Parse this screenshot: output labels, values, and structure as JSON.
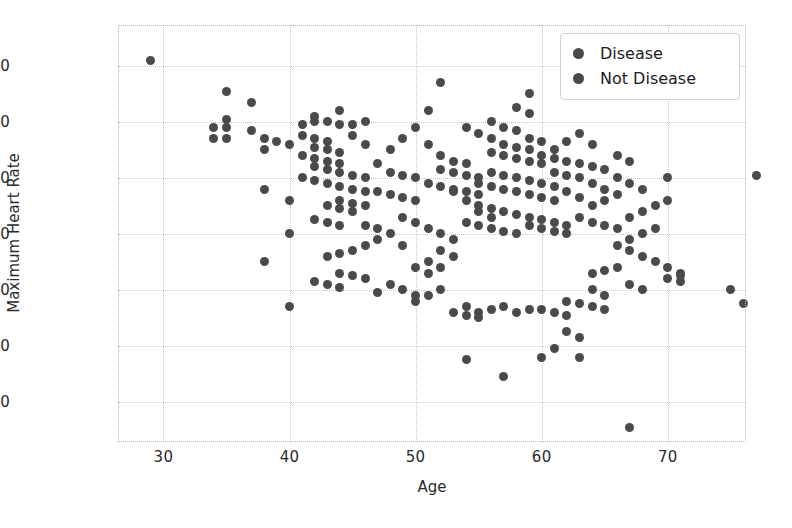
{
  "chart_data": {
    "type": "scatter",
    "title": "",
    "xlabel": "Age",
    "ylabel": "Maximum Heart Rate",
    "xlim": [
      26.4,
      76.2
    ],
    "ylim": [
      65.7,
      214.6
    ],
    "xticks": [
      30,
      40,
      50,
      60,
      70
    ],
    "yticks": [
      80,
      100,
      120,
      140,
      160,
      180,
      200
    ],
    "grid": true,
    "legend_position": "upper right",
    "marker_size_px": 9,
    "series": [
      {
        "name": "Disease",
        "color": "#4a4a4a",
        "points": [
          [
            29,
            202
          ],
          [
            35,
            191
          ],
          [
            37,
            187
          ],
          [
            35,
            181
          ],
          [
            34,
            178
          ],
          [
            35,
            178
          ],
          [
            37,
            177
          ],
          [
            38,
            174
          ],
          [
            34,
            174
          ],
          [
            35,
            174
          ],
          [
            39,
            173
          ],
          [
            40,
            172
          ],
          [
            38,
            170
          ],
          [
            41,
            179
          ],
          [
            42,
            180
          ],
          [
            43,
            180
          ],
          [
            44,
            179
          ],
          [
            45,
            179
          ],
          [
            46,
            180
          ],
          [
            42,
            182
          ],
          [
            44,
            184
          ],
          [
            41,
            175
          ],
          [
            42,
            174
          ],
          [
            43,
            173
          ],
          [
            42,
            171
          ],
          [
            43,
            170
          ],
          [
            44,
            169
          ],
          [
            41,
            168
          ],
          [
            42,
            167
          ],
          [
            43,
            166
          ],
          [
            44,
            165
          ],
          [
            42,
            164
          ],
          [
            43,
            163
          ],
          [
            45,
            175
          ],
          [
            46,
            172
          ],
          [
            44,
            162
          ],
          [
            45,
            161
          ],
          [
            46,
            160
          ],
          [
            41,
            160
          ],
          [
            42,
            159
          ],
          [
            43,
            158
          ],
          [
            44,
            157
          ],
          [
            45,
            156
          ],
          [
            46,
            155
          ],
          [
            47,
            165
          ],
          [
            48,
            170
          ],
          [
            49,
            174
          ],
          [
            50,
            178
          ],
          [
            51,
            184
          ],
          [
            52,
            194
          ],
          [
            51,
            172
          ],
          [
            52,
            168
          ],
          [
            53,
            166
          ],
          [
            54,
            165
          ],
          [
            52,
            163
          ],
          [
            53,
            162
          ],
          [
            54,
            161
          ],
          [
            55,
            160
          ],
          [
            51,
            158
          ],
          [
            52,
            157
          ],
          [
            53,
            156
          ],
          [
            54,
            155
          ],
          [
            55,
            154
          ],
          [
            48,
            162
          ],
          [
            49,
            161
          ],
          [
            50,
            160
          ],
          [
            47,
            155
          ],
          [
            48,
            154
          ],
          [
            49,
            153
          ],
          [
            50,
            152
          ],
          [
            44,
            152
          ],
          [
            45,
            151
          ],
          [
            46,
            150
          ],
          [
            43,
            150
          ],
          [
            44,
            149
          ],
          [
            45,
            148
          ],
          [
            42,
            145
          ],
          [
            43,
            144
          ],
          [
            44,
            143
          ],
          [
            46,
            143
          ],
          [
            47,
            142
          ],
          [
            43,
            132
          ],
          [
            44,
            126
          ],
          [
            45,
            125
          ],
          [
            46,
            124
          ],
          [
            42,
            123
          ],
          [
            43,
            122
          ],
          [
            44,
            121
          ],
          [
            40,
            140
          ],
          [
            40,
            152
          ],
          [
            40,
            114
          ],
          [
            38,
            156
          ],
          [
            38,
            130
          ],
          [
            47,
            119
          ],
          [
            48,
            122
          ],
          [
            49,
            136
          ],
          [
            50,
            128
          ],
          [
            51,
            126
          ],
          [
            52,
            128
          ],
          [
            53,
            132
          ]
        ]
      },
      {
        "name": "Not Disease",
        "color": "#4a4a4a",
        "points": [
          [
            56,
            180
          ],
          [
            57,
            178
          ],
          [
            58,
            177
          ],
          [
            59,
            174
          ],
          [
            60,
            173
          ],
          [
            57,
            172
          ],
          [
            58,
            171
          ],
          [
            59,
            170
          ],
          [
            56,
            169
          ],
          [
            57,
            168
          ],
          [
            58,
            167
          ],
          [
            59,
            166
          ],
          [
            60,
            165
          ],
          [
            61,
            170
          ],
          [
            62,
            173
          ],
          [
            63,
            176
          ],
          [
            64,
            172
          ],
          [
            62,
            166
          ],
          [
            63,
            165
          ],
          [
            64,
            164
          ],
          [
            65,
            163
          ],
          [
            61,
            162
          ],
          [
            62,
            161
          ],
          [
            63,
            160
          ],
          [
            56,
            162
          ],
          [
            57,
            161
          ],
          [
            58,
            160
          ],
          [
            59,
            159
          ],
          [
            60,
            158
          ],
          [
            55,
            158
          ],
          [
            56,
            157
          ],
          [
            57,
            156
          ],
          [
            58,
            155
          ],
          [
            59,
            154
          ],
          [
            60,
            153
          ],
          [
            61,
            152
          ],
          [
            55,
            150
          ],
          [
            56,
            149
          ],
          [
            57,
            148
          ],
          [
            58,
            147
          ],
          [
            59,
            146
          ],
          [
            60,
            145
          ],
          [
            61,
            144
          ],
          [
            62,
            143
          ],
          [
            54,
            144
          ],
          [
            55,
            143
          ],
          [
            56,
            142
          ],
          [
            57,
            141
          ],
          [
            58,
            140
          ],
          [
            59,
            143
          ],
          [
            60,
            142
          ],
          [
            61,
            141
          ],
          [
            62,
            140
          ],
          [
            63,
            146
          ],
          [
            64,
            150
          ],
          [
            65,
            152
          ],
          [
            66,
            154
          ],
          [
            64,
            144
          ],
          [
            65,
            143
          ],
          [
            66,
            142
          ],
          [
            67,
            146
          ],
          [
            68,
            148
          ],
          [
            69,
            150
          ],
          [
            70,
            152
          ],
          [
            66,
            136
          ],
          [
            67,
            134
          ],
          [
            68,
            132
          ],
          [
            69,
            130
          ],
          [
            70,
            128
          ],
          [
            71,
            126
          ],
          [
            70,
            124
          ],
          [
            71,
            123
          ],
          [
            67,
            122
          ],
          [
            68,
            120
          ],
          [
            64,
            120
          ],
          [
            65,
            118
          ],
          [
            62,
            116
          ],
          [
            63,
            115
          ],
          [
            64,
            114
          ],
          [
            65,
            113
          ],
          [
            60,
            113
          ],
          [
            61,
            112
          ],
          [
            62,
            111
          ],
          [
            59,
            113
          ],
          [
            58,
            112
          ],
          [
            57,
            114
          ],
          [
            56,
            113
          ],
          [
            55,
            112
          ],
          [
            54,
            114
          ],
          [
            62,
            105
          ],
          [
            63,
            103
          ],
          [
            61,
            99
          ],
          [
            60,
            96
          ],
          [
            63,
            96
          ],
          [
            57,
            89
          ],
          [
            54,
            95
          ],
          [
            67,
            71
          ],
          [
            75,
            120
          ],
          [
            77,
            161
          ],
          [
            70,
            160
          ],
          [
            76,
            115
          ],
          [
            71,
            125
          ],
          [
            53,
            112
          ],
          [
            54,
            111
          ],
          [
            55,
            110
          ],
          [
            52,
            120
          ],
          [
            51,
            118
          ],
          [
            50,
            116
          ],
          [
            53,
            155
          ],
          [
            54,
            152
          ],
          [
            55,
            148
          ],
          [
            56,
            146
          ],
          [
            61,
            157
          ],
          [
            62,
            155
          ],
          [
            63,
            153
          ],
          [
            64,
            158
          ],
          [
            65,
            156
          ],
          [
            66,
            160
          ],
          [
            67,
            158
          ],
          [
            68,
            156
          ],
          [
            69,
            142
          ],
          [
            68,
            140
          ],
          [
            67,
            138
          ],
          [
            66,
            128
          ],
          [
            65,
            127
          ],
          [
            64,
            126
          ],
          [
            49,
            146
          ],
          [
            50,
            144
          ],
          [
            51,
            142
          ],
          [
            52,
            140
          ],
          [
            53,
            138
          ],
          [
            48,
            140
          ],
          [
            47,
            138
          ],
          [
            46,
            136
          ],
          [
            45,
            134
          ],
          [
            44,
            133
          ],
          [
            49,
            120
          ],
          [
            50,
            118
          ],
          [
            51,
            130
          ],
          [
            52,
            134
          ],
          [
            59,
            190
          ],
          [
            54,
            178
          ],
          [
            55,
            176
          ],
          [
            56,
            174
          ],
          [
            60,
            168
          ],
          [
            61,
            167
          ],
          [
            66,
            168
          ],
          [
            67,
            166
          ],
          [
            58,
            185
          ],
          [
            59,
            183
          ]
        ]
      }
    ]
  },
  "legend": {
    "items": [
      {
        "label": "Disease",
        "color": "#4a4a4a"
      },
      {
        "label": "Not Disease",
        "color": "#4a4a4a"
      }
    ]
  },
  "axes": {
    "x_label": "Age",
    "y_label": "Maximum Heart Rate",
    "x_tick_labels": [
      "30",
      "40",
      "50",
      "60",
      "70"
    ],
    "y_tick_labels": [
      "80",
      "100",
      "120",
      "140",
      "160",
      "180",
      "200"
    ]
  },
  "style": {
    "background": "#ffffff",
    "grid_color": "#c6c6c6",
    "marker_color": "#4a4a4a",
    "text_color": "#2b2b2b"
  }
}
